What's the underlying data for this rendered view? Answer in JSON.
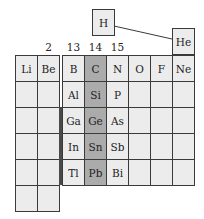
{
  "diagram": {
    "type": "partial-periodic-table",
    "highlight_color": "#ababab",
    "cell_color": "#ececec",
    "line_color": "#3a3a3a",
    "floating": [
      {
        "symbol": "H",
        "x": 92,
        "y": 9
      },
      {
        "symbol": "He",
        "x": 172,
        "y": 28
      }
    ],
    "group_labels": [
      {
        "label": "2",
        "col": 1
      },
      {
        "label": "13",
        "col": 2
      },
      {
        "label": "14",
        "col": 3
      },
      {
        "label": "15",
        "col": 4
      }
    ],
    "highlighted_column": 3,
    "rows": [
      [
        "Li",
        "Be",
        "B",
        "C",
        "N",
        "O",
        "F",
        "Ne"
      ],
      [
        "",
        "",
        "Al",
        "Si",
        "P",
        "",
        "",
        ""
      ],
      [
        "",
        "",
        "Ga",
        "Ge",
        "As",
        "",
        "",
        ""
      ],
      [
        "",
        "",
        "In",
        "Sn",
        "Sb",
        "",
        "",
        ""
      ],
      [
        "",
        "",
        "Tl",
        "Pb",
        "Bi",
        "",
        "",
        ""
      ],
      [
        "",
        ""
      ]
    ]
  }
}
